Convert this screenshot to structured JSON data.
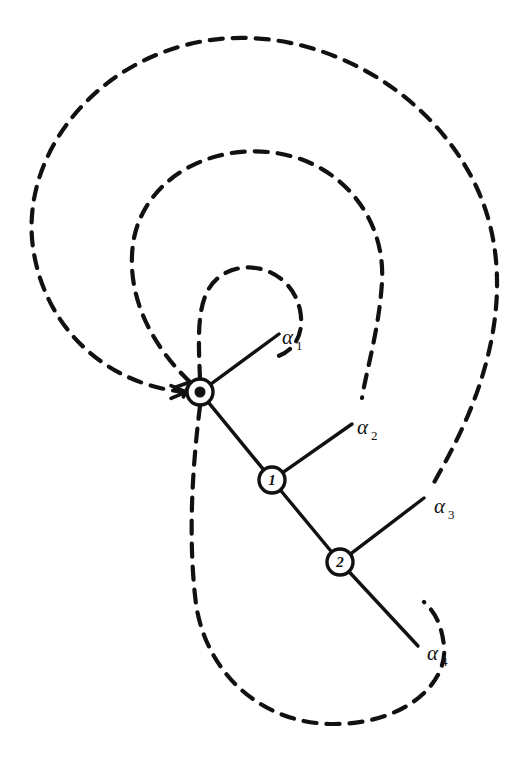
{
  "figure": {
    "kind": "diagram",
    "background_color": "#ffffff",
    "ink_color": "#111111",
    "width": 528,
    "height": 768
  },
  "style": {
    "solid_stroke_color": "#111111",
    "solid_stroke_width": 3.4,
    "dashed_stroke_color": "#111111",
    "dashed_stroke_width": 4.2,
    "dash_pattern": "13 10",
    "node_fill": "#ffffff",
    "node_stroke": "#111111"
  },
  "nodes": [
    {
      "id": "node-0",
      "label": "0",
      "cx": 200,
      "cy": 392,
      "r": 13,
      "inner_r": 5.5,
      "double_ring": true,
      "label_size": 15
    },
    {
      "id": "node-1",
      "label": "1",
      "cx": 272,
      "cy": 480,
      "r": 13,
      "inner_r": 0,
      "double_ring": false,
      "label_size": 15
    },
    {
      "id": "node-2",
      "label": "2",
      "cx": 340,
      "cy": 562,
      "r": 13,
      "inner_r": 0,
      "double_ring": false,
      "label_size": 15
    }
  ],
  "branches": [
    {
      "id": "branch-alpha-1",
      "label": "α",
      "subscript": "1",
      "from_node": "node-0",
      "tip_x": 279,
      "tip_y": 334,
      "label_x": 282,
      "label_y": 344
    },
    {
      "id": "branch-alpha-2",
      "label": "α",
      "subscript": "2",
      "from_node": "node-1",
      "tip_x": 352,
      "tip_y": 424,
      "label_x": 357,
      "label_y": 434
    },
    {
      "id": "branch-alpha-3",
      "label": "α",
      "subscript": "3",
      "from_node": "node-2",
      "tip_x": 424,
      "tip_y": 498,
      "label_x": 434,
      "label_y": 513
    },
    {
      "id": "branch-alpha-4",
      "label": "α",
      "subscript": "4",
      "from_node": "node-2",
      "tip_x": 418,
      "tip_y": 646,
      "label_x": 427,
      "label_y": 660
    }
  ],
  "edges": [
    {
      "id": "edge-0-1",
      "from": "node-0",
      "to": "node-1"
    },
    {
      "id": "edge-1-2",
      "from": "node-1",
      "to": "node-2"
    }
  ],
  "loops": [
    {
      "id": "loop-1",
      "name": "innermost-dashed-loop",
      "encloses": [
        "branch-alpha-1"
      ],
      "arrow_direction": "from-above",
      "path": "M 200 379 C 198 330, 196 292, 222 275 C 250 257, 292 272, 300 310 C 306 340, 288 356, 270 358"
    },
    {
      "id": "loop-2",
      "name": "second-dashed-loop",
      "encloses": [
        "branch-alpha-1",
        "branch-alpha-2"
      ],
      "arrow_direction": "from-upper-left",
      "path": "M 190 382 C 150 344, 124 292, 134 238 C 146 180, 206 146, 268 152 C 336 158, 386 214, 382 282 C 379 330, 366 372, 362 398"
    },
    {
      "id": "loop-3",
      "name": "third-dashed-loop",
      "encloses": [
        "branch-alpha-1",
        "branch-alpha-2",
        "branch-alpha-3"
      ],
      "arrow_direction": "from-left",
      "path": "M 186 392 C 110 386, 48 332, 34 254 C 18 166, 82 74, 182 46 C 296 14, 426 80, 476 186 C 510 258, 500 342, 466 420 C 450 456, 436 478, 430 490"
    },
    {
      "id": "loop-4",
      "name": "outermost-dashed-loop",
      "encloses": [
        "branch-alpha-1",
        "branch-alpha-2",
        "branch-alpha-3",
        "branch-alpha-4"
      ],
      "arrow_direction": "from-below",
      "path": "M 200 406 C 192 470, 188 540, 196 604 C 206 672, 260 724, 334 724 C 404 724, 448 684, 444 646 C 441 618, 430 608, 424 602"
    }
  ],
  "arrowheads": [
    {
      "id": "arrowhead-loop-1",
      "x": 200,
      "y": 379,
      "angle": 90,
      "target": "node-0"
    },
    {
      "id": "arrowhead-loop-2",
      "x": 190,
      "y": 382,
      "angle": 43,
      "target": "node-0"
    },
    {
      "id": "arrowhead-loop-3",
      "x": 186,
      "y": 392,
      "angle": 0,
      "target": "node-0"
    },
    {
      "id": "arrowhead-loop-4",
      "x": 200,
      "y": 406,
      "angle": 270,
      "target": "node-0"
    }
  ]
}
